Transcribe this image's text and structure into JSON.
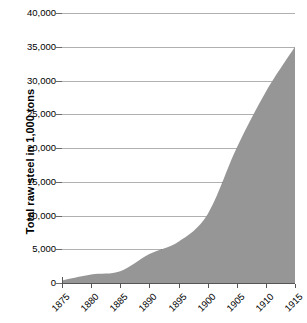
{
  "chart_data": {
    "type": "area",
    "title": "",
    "subtitle": "",
    "xlabel": "",
    "ylabel": "Total raw steel in 1,000 tons",
    "x": [
      1875,
      1880,
      1885,
      1890,
      1895,
      1900,
      1905,
      1910,
      1915
    ],
    "values": [
      380,
      1250,
      1740,
      4280,
      6110,
      10190,
      20020,
      28330,
      35000
    ],
    "categories": [
      "1875",
      "1880",
      "1885",
      "1890",
      "1895",
      "1900",
      "1905",
      "1910",
      "1915"
    ],
    "xtick_labels": [
      "1875",
      "1880",
      "1885",
      "1890",
      "1895",
      "1900",
      "1905",
      "1910",
      "1915"
    ],
    "ytick_labels": [
      "0",
      "5,000",
      "10,000",
      "15,000",
      "20,000",
      "25,000",
      "30,000",
      "35,000",
      "40,000"
    ],
    "ytick_values": [
      0,
      5000,
      10000,
      15000,
      20000,
      25000,
      30000,
      35000,
      40000
    ],
    "xlim": [
      1875,
      1915
    ],
    "ylim": [
      0,
      40000
    ],
    "grid": true,
    "legend": false,
    "legend_position": "none",
    "series": [
      {
        "name": "Total raw steel",
        "values": [
          380,
          1250,
          1740,
          4280,
          6110,
          10190,
          20020,
          28330,
          35000
        ]
      }
    ],
    "colors": {
      "area_fill": "#969696",
      "gridline_light": "#b0b0b0",
      "gridline_dark": "#4a4a4a",
      "axis": "#555555",
      "text": "#000000",
      "background": "#ffffff"
    }
  },
  "axes": {
    "y_title": "Total raw steel in 1,000 tons",
    "y_ticks": [
      {
        "label": "40,000",
        "value": 40000
      },
      {
        "label": "35,000",
        "value": 35000
      },
      {
        "label": "30,000",
        "value": 30000
      },
      {
        "label": "25,000",
        "value": 25000
      },
      {
        "label": "20,000",
        "value": 20000
      },
      {
        "label": "15,000",
        "value": 15000
      },
      {
        "label": "10,000",
        "value": 10000
      },
      {
        "label": "5,000",
        "value": 5000
      },
      {
        "label": "0",
        "value": 0
      }
    ],
    "x_ticks": [
      {
        "label": "1875",
        "value": 1875
      },
      {
        "label": "1880",
        "value": 1880
      },
      {
        "label": "1885",
        "value": 1885
      },
      {
        "label": "1890",
        "value": 1890
      },
      {
        "label": "1895",
        "value": 1895
      },
      {
        "label": "1900",
        "value": 1900
      },
      {
        "label": "1905",
        "value": 1905
      },
      {
        "label": "1910",
        "value": 1910
      },
      {
        "label": "1915",
        "value": 1915
      }
    ]
  }
}
